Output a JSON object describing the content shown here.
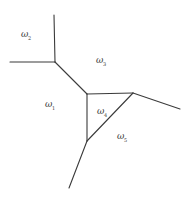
{
  "diagram": {
    "type": "voronoi-partition",
    "regions": [
      {
        "id": "w1",
        "symbol": "ω",
        "subscript": "1",
        "x": 45,
        "y": 107
      },
      {
        "id": "w2",
        "symbol": "ω",
        "subscript": "2",
        "x": 21,
        "y": 37
      },
      {
        "id": "w3",
        "symbol": "ω",
        "subscript": "3",
        "x": 96,
        "y": 63
      },
      {
        "id": "w4",
        "symbol": "ω",
        "subscript": "4",
        "x": 97,
        "y": 114
      },
      {
        "id": "w5",
        "symbol": "ω",
        "subscript": "5",
        "x": 117,
        "y": 139
      }
    ],
    "vertices": {
      "A": [
        55,
        62
      ],
      "B": [
        87,
        94
      ],
      "C": [
        133,
        93
      ],
      "D": [
        87,
        141
      ]
    },
    "edges": [
      {
        "from": [
          54,
          15
        ],
        "to": [
          55,
          62
        ]
      },
      {
        "from": [
          10,
          62
        ],
        "to": [
          55,
          62
        ]
      },
      {
        "from": [
          55,
          62
        ],
        "to": [
          87,
          94
        ]
      },
      {
        "from": [
          87,
          94
        ],
        "to": [
          133,
          93
        ]
      },
      {
        "from": [
          87,
          94
        ],
        "to": [
          87,
          141
        ]
      },
      {
        "from": [
          87,
          141
        ],
        "to": [
          133,
          93
        ]
      },
      {
        "from": [
          133,
          93
        ],
        "to": [
          180,
          109
        ]
      },
      {
        "from": [
          87,
          141
        ],
        "to": [
          69,
          188
        ]
      }
    ]
  }
}
